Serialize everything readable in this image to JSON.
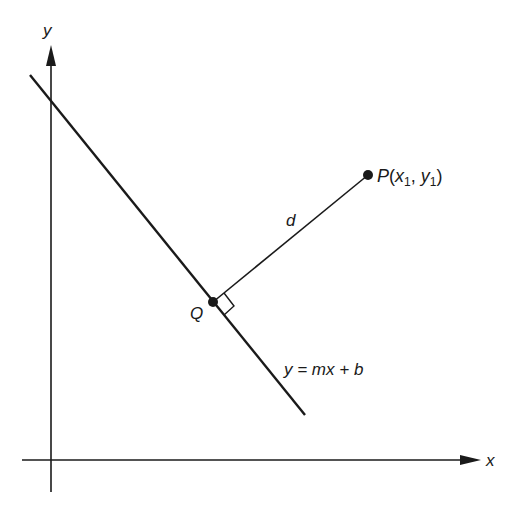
{
  "diagram": {
    "title": "",
    "axes": {
      "x_label": "x",
      "y_label": "y"
    },
    "line": {
      "equation": "y = mx + b"
    },
    "points": {
      "P": {
        "name": "P",
        "open": "(",
        "x": "x",
        "x_sub": "1",
        "sep": ", ",
        "y": "y",
        "y_sub": "1",
        "close": ")"
      },
      "Q": {
        "name": "Q"
      }
    },
    "distance_label": "d",
    "colors": {
      "stroke": "#1a1a1a",
      "background": "#ffffff"
    }
  }
}
